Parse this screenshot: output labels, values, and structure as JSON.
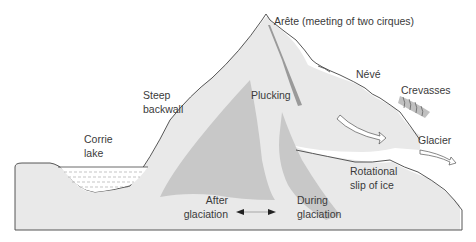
{
  "diagram": {
    "labels": {
      "arete": "Arête (meeting of two cirques)",
      "neve": "Névé",
      "crevasses": "Crevasses",
      "steep_backwall_1": "Steep",
      "steep_backwall_2": "backwall",
      "plucking": "Plucking",
      "glacier": "Glacier",
      "corrie_lake_1": "Corrie",
      "corrie_lake_2": "lake",
      "rotational_1": "Rotational",
      "rotational_2": "slip of ice",
      "after_1": "After",
      "after_2": "glaciation",
      "during_1": "During",
      "during_2": "glaciation"
    },
    "colors": {
      "ground_fill": "#e8e8e8",
      "ice_dark": "#c6c6c6",
      "outline": "#444444",
      "text": "#3a3a3a"
    },
    "arrows": [
      "ice-flow-arrow-upper",
      "ice-flow-arrow-glacier",
      "comparison-double-arrow"
    ]
  }
}
